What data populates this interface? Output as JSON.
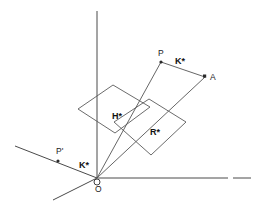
{
  "figure": {
    "background_color": "#ffffff",
    "line_color": "#555555",
    "label_color": "#111111",
    "width": 264,
    "height": 205
  },
  "labels": {
    "origin": "O",
    "point_p": "P",
    "point_p_prime": "P'",
    "point_a": "A",
    "k_star_upper": "K*",
    "k_star_lower": "K*",
    "h_star": "H*",
    "r_star": "R*"
  },
  "geometry": {
    "origin": {
      "x": 97,
      "y": 178
    },
    "axes": [
      {
        "name": "vertical-axis",
        "x1": 97,
        "y1": 11,
        "x2": 97,
        "y2": 178
      },
      {
        "name": "horizontal-axis",
        "x1": 97,
        "y1": 178,
        "x2": 228,
        "y2": 178
      },
      {
        "name": "horizontal-axis-dash",
        "x1": 233,
        "y1": 178,
        "x2": 251,
        "y2": 178
      },
      {
        "name": "axis-lower-left",
        "x1": 97,
        "y1": 178,
        "x2": 53,
        "y2": 200
      },
      {
        "name": "axis-upper-left-through-p-prime",
        "x1": 97,
        "y1": 178,
        "x2": 15,
        "y2": 146
      }
    ],
    "rays": [
      {
        "name": "ray-to-p",
        "x1": 97,
        "y1": 178,
        "x2": 161,
        "y2": 62
      },
      {
        "name": "ray-to-a",
        "x1": 97,
        "y1": 178,
        "x2": 205,
        "y2": 77
      }
    ],
    "segments": [
      {
        "name": "segment-p-to-a",
        "x1": 161,
        "y1": 62,
        "x2": 205,
        "y2": 77
      }
    ],
    "planes": [
      {
        "name": "plane-h-star",
        "points": "78,109 113,85 150,107 115,133"
      },
      {
        "name": "plane-r-star",
        "points": "114,122 149,99 186,122 151,155"
      }
    ],
    "points": [
      {
        "name": "point-p",
        "x": 161,
        "y": 62,
        "marker": "dot"
      },
      {
        "name": "point-a",
        "x": 205,
        "y": 77,
        "marker": "square"
      },
      {
        "name": "point-p-prime",
        "x": 58,
        "y": 161,
        "marker": "dot"
      },
      {
        "name": "point-o",
        "x": 97,
        "y": 178,
        "marker": "circle"
      }
    ],
    "label_positions": {
      "point_p": {
        "x": 158,
        "y": 56
      },
      "point_a": {
        "x": 210,
        "y": 80
      },
      "point_p_prime": {
        "x": 56,
        "y": 154
      },
      "origin": {
        "x": 95,
        "y": 192
      },
      "k_star_upper": {
        "x": 175,
        "y": 64
      },
      "k_star_lower": {
        "x": 79,
        "y": 168
      },
      "h_star": {
        "x": 112,
        "y": 119
      },
      "r_star": {
        "x": 150,
        "y": 135
      }
    }
  }
}
